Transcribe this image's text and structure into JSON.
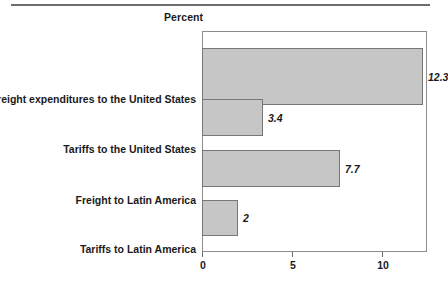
{
  "chart_data": {
    "type": "bar",
    "orientation": "horizontal",
    "title": "",
    "xlabel": "Percent",
    "ylabel": "",
    "xlim": [
      0,
      12.4
    ],
    "ticks": [
      {
        "value": 0,
        "label": "0"
      },
      {
        "value": 5,
        "label": "5"
      },
      {
        "value": 10,
        "label": "10"
      }
    ],
    "grid": false,
    "legend": null,
    "categories": [
      "Freight expenditures to the United States",
      "Tariffs to the United States",
      "Freight to Latin America",
      "Tariffs to Latin America"
    ],
    "values": [
      12.3,
      3.4,
      7.7,
      2
    ],
    "value_labels": [
      "12.3",
      "3.4",
      "7.7",
      "2"
    ],
    "bar_color": "#c6c6c6",
    "bar_border_color": "#777777",
    "frame_color": "#8c8c8c",
    "rule_color": "#6d6d6d"
  },
  "header": {
    "axis_title": "Percent"
  }
}
